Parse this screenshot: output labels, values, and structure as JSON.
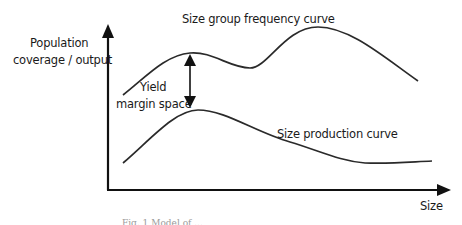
{
  "diagram": {
    "y_axis_label_line1": "Population",
    "y_axis_label_line2": "coverage / output",
    "x_axis_label": "Size",
    "top_curve_label": "Size group frequency curve",
    "bottom_curve_label": "Size production curve",
    "gap_label_line1": "Yield",
    "gap_label_line2": "margin space",
    "caption": "Fig. 1  Model of ...",
    "colors": {
      "line": "#2a2a2a",
      "axis": "#111111",
      "text": "#1a1a1a",
      "background": "#ffffff"
    }
  }
}
